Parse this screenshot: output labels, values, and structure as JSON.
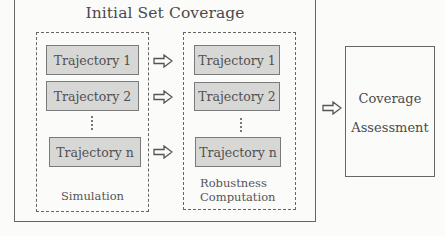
{
  "diagram": {
    "outer_box": {
      "title": "Initial Set Coverage"
    },
    "simulation_box": {
      "label": "Simulation",
      "trajectories": [
        "Trajectory 1",
        "Trajectory 2",
        "Trajectory n"
      ],
      "ellipsis": "vertical-dots"
    },
    "robustness_box": {
      "label_line1": "Robustness",
      "label_line2": "Computation",
      "trajectories": [
        "Trajectory 1",
        "Trajectory 2",
        "Trajectory n"
      ],
      "ellipsis": "vertical-dots"
    },
    "arrows": [
      {
        "from": "Simulation Trajectory 1",
        "to": "Robustness Trajectory 1",
        "icon": "hollow-right-arrow-icon"
      },
      {
        "from": "Simulation Trajectory 2",
        "to": "Robustness Trajectory 2",
        "icon": "hollow-right-arrow-icon"
      },
      {
        "from": "Simulation Trajectory n",
        "to": "Robustness Trajectory n",
        "icon": "hollow-right-arrow-icon"
      },
      {
        "from": "Initial Set Coverage",
        "to": "Coverage Assessment",
        "icon": "hollow-right-arrow-icon"
      }
    ],
    "assessment_box": {
      "line1": "Coverage",
      "line2": "Assessment"
    },
    "colors": {
      "background": "#fbfbfa",
      "trajectory_fill": "#d7d7d5",
      "trajectory_border": "#7a7a7a",
      "line": "#666666",
      "text": "#4a4a4a"
    }
  }
}
